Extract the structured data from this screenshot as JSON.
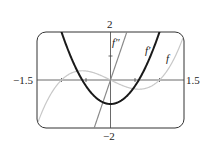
{
  "chart_data": {
    "type": "line",
    "title": "",
    "xlabel": "",
    "ylabel": "",
    "xlim": [
      -1.5,
      1.5
    ],
    "ylim": [
      -2,
      2
    ],
    "grid": false,
    "x_tick_labels": [
      "-1.5",
      "1.5"
    ],
    "y_tick_labels": [
      "2",
      "-2"
    ],
    "x_ticks": [
      -1,
      -0.5,
      0.5,
      1
    ],
    "y_ticks": [
      -1,
      1
    ],
    "series": [
      {
        "name": "f",
        "expression": "x^3 - x",
        "color": "#c8c8c8",
        "width": 1.2
      },
      {
        "name": "f'",
        "expression": "3x^2 - 1",
        "color": "#1a1a1a",
        "width": 2.0
      },
      {
        "name": "f''",
        "expression": "6x",
        "color": "#8a8a8a",
        "width": 1.2
      }
    ],
    "annotations": [
      {
        "text": "f''",
        "x": 0.05,
        "y": 1.55
      },
      {
        "text": "f'",
        "x": 0.67,
        "y": 1.0
      },
      {
        "text": "f",
        "x": 1.12,
        "y": 0.6
      }
    ]
  },
  "labels": {
    "xmin": "−1.5",
    "xmax": "1.5",
    "ymax": "2",
    "ymin": "−2",
    "f": "f",
    "fprime": "f′",
    "fdoubleprime": "f″"
  }
}
